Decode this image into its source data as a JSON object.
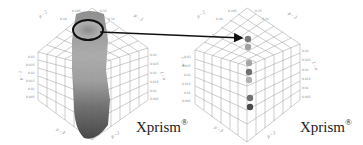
{
  "figure": {
    "panels": [
      {
        "id": "left",
        "description": "3D prism plot with dense point cloud",
        "label": "Xprism",
        "label_mark": "®",
        "highlight": "ellipse around top cluster",
        "axis_labels": [
          "μ - 2",
          "μ - 3",
          "μ - 1",
          "1 - n",
          "μ - 3",
          "μ - 2"
        ],
        "tick_labels": [
          "0.495",
          "0.48",
          "0.465",
          "0.45",
          "0.435",
          "0.42",
          "0.03",
          "0.025",
          "0.02",
          "0.015",
          "0.01",
          "0.005",
          "0.0",
          "0.35",
          "0.34",
          "0.33",
          "0.32",
          "0.31"
        ]
      },
      {
        "id": "right",
        "description": "3D prism plot with selected points",
        "label": "Xprism",
        "label_mark": "®",
        "points": 7,
        "axis_labels": [
          "μ - 2",
          "μ - 3",
          "μ - 1",
          "1 - n",
          "μ - 3",
          "μ - 2"
        ],
        "tick_labels": [
          "0.495",
          "0.48",
          "0.465",
          "0.45",
          "0.435",
          "0.42",
          "0.03",
          "0.025",
          "0.02",
          "0.015",
          "0.01",
          "0.005",
          "0.0",
          "0.35",
          "0.34",
          "0.33",
          "0.32",
          "0.31"
        ]
      }
    ],
    "arrow": {
      "from": "left-ellipse",
      "to": "right-top-point"
    },
    "colors": {
      "grid": "#9a9a9a",
      "points_light": "#a0a0a0",
      "points_dark": "#505050",
      "arrow": "#111111"
    }
  }
}
